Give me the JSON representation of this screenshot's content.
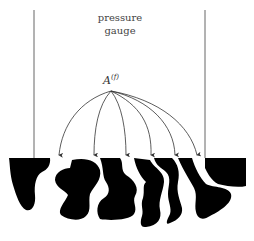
{
  "diagram": {
    "label_top_line1": "pressure",
    "label_top_line2": "gauge",
    "node_label": "A",
    "node_superscript": "(f)",
    "arrow_count": 6,
    "colors": {
      "line": "#555555",
      "fill": "#000000",
      "text": "#444444"
    }
  }
}
